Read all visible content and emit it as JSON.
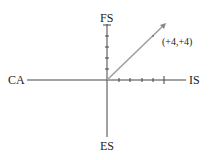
{
  "diagram": {
    "axes": {
      "left": "CA",
      "right": "IS",
      "top": "FS",
      "bottom": "ES"
    },
    "vector": {
      "label": "(+4,+4)",
      "x": 4,
      "y": 4,
      "color": "#a0a0a0"
    },
    "axis_color": "#444444",
    "tick_count_positive_x": 5,
    "tick_count_positive_y": 5
  }
}
